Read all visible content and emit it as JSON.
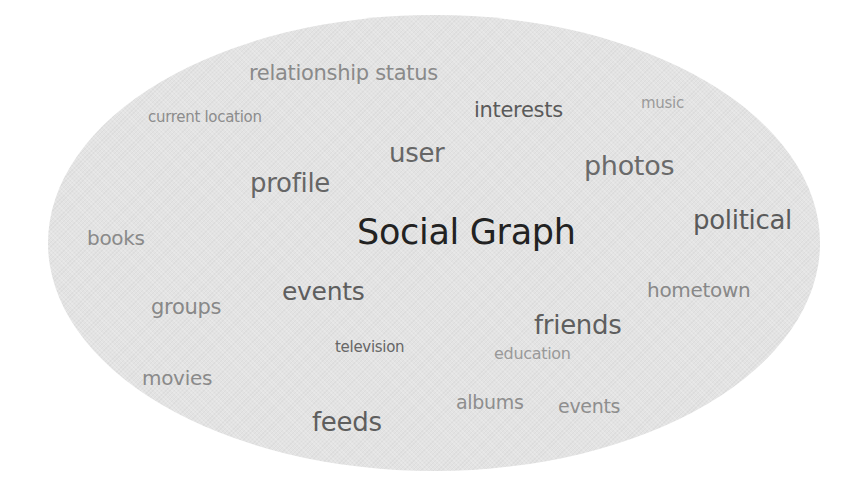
{
  "title": "Social Graph",
  "colors": {
    "background": "#ffffff",
    "cloud": "#e3e3e3",
    "title": "#222222"
  },
  "words": [
    {
      "text": "relationship status",
      "x": 249,
      "y": 63,
      "size": 21,
      "color": "#8a8a8a"
    },
    {
      "text": "current location",
      "x": 148,
      "y": 110,
      "size": 15,
      "color": "#8c8c8c"
    },
    {
      "text": "interests",
      "x": 474,
      "y": 100,
      "size": 21,
      "color": "#5a5a5a"
    },
    {
      "text": "music",
      "x": 641,
      "y": 96,
      "size": 15,
      "color": "#9a9a9a"
    },
    {
      "text": "user",
      "x": 389,
      "y": 140,
      "size": 26,
      "color": "#666666"
    },
    {
      "text": "photos",
      "x": 584,
      "y": 152,
      "size": 27,
      "color": "#6a6a6a"
    },
    {
      "text": "profile",
      "x": 250,
      "y": 170,
      "size": 26,
      "color": "#666666"
    },
    {
      "text": "Social Graph",
      "x": 357,
      "y": 215,
      "size": 35,
      "color": "#222222"
    },
    {
      "text": "political",
      "x": 693,
      "y": 207,
      "size": 26,
      "color": "#5a5a5a"
    },
    {
      "text": "books",
      "x": 87,
      "y": 228,
      "size": 20,
      "color": "#8a8a8a"
    },
    {
      "text": "events",
      "x": 282,
      "y": 279,
      "size": 25,
      "color": "#5e5e5e"
    },
    {
      "text": "hometown",
      "x": 647,
      "y": 280,
      "size": 20,
      "color": "#888888"
    },
    {
      "text": "groups",
      "x": 151,
      "y": 297,
      "size": 21,
      "color": "#888888"
    },
    {
      "text": "friends",
      "x": 534,
      "y": 312,
      "size": 26,
      "color": "#5e5e5e"
    },
    {
      "text": "television",
      "x": 335,
      "y": 340,
      "size": 15,
      "color": "#666666"
    },
    {
      "text": "education",
      "x": 494,
      "y": 346,
      "size": 16,
      "color": "#999999"
    },
    {
      "text": "movies",
      "x": 142,
      "y": 368,
      "size": 20,
      "color": "#8a8a8a"
    },
    {
      "text": "albums",
      "x": 456,
      "y": 393,
      "size": 19,
      "color": "#8e8e8e"
    },
    {
      "text": "events",
      "x": 558,
      "y": 397,
      "size": 19,
      "color": "#8e8e8e"
    },
    {
      "text": "feeds",
      "x": 312,
      "y": 409,
      "size": 26,
      "color": "#5e5e5e"
    }
  ]
}
